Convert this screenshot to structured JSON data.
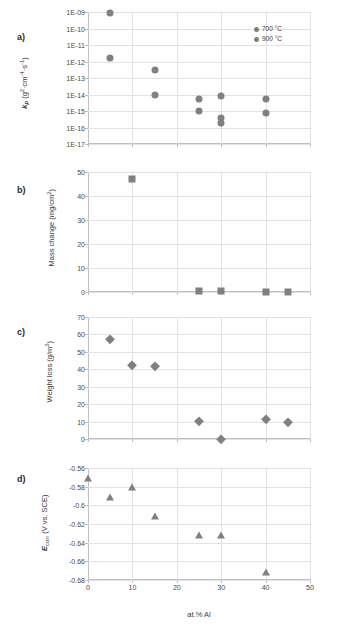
{
  "figure": {
    "xlabel": "at.% Al",
    "series_colors": {
      "marker": "#808080",
      "grid": "#e2e2e2",
      "axis": "#bfbfbf"
    }
  },
  "panels": [
    {
      "letter": "a)",
      "ylabel_plain": "kp (g2·cm-4·s-1)",
      "ylabel_parts": {
        "sym": "k",
        "sub": "p",
        "unit_open": " (g",
        "u1": "2",
        "u2": "·cm",
        "u3": "-4",
        "u4": "·s",
        "u5": "-1",
        "unit_close": ")"
      },
      "yticks": [
        "1E-09",
        "1E-10",
        "1E-11",
        "1E-12",
        "1E-13",
        "1E-14",
        "1E-15",
        "1E-16",
        "1E-17"
      ],
      "ylim_exp": [
        -17,
        -9
      ],
      "xticks": [
        "0",
        "10",
        "20",
        "30",
        "40",
        "50"
      ],
      "xlim": [
        0,
        50
      ],
      "legend": [
        {
          "label": "700 °C",
          "color": "#808080"
        },
        {
          "label": "900 °C",
          "color": "#808080"
        }
      ],
      "points": [
        {
          "x": 5,
          "y_exp": -9.05,
          "marker": "circle"
        },
        {
          "x": 5,
          "y_exp": -11.8,
          "marker": "circle"
        },
        {
          "x": 15,
          "y_exp": -12.5,
          "marker": "circle"
        },
        {
          "x": 15,
          "y_exp": -14.0,
          "marker": "circle"
        },
        {
          "x": 25,
          "y_exp": -14.25,
          "marker": "circle"
        },
        {
          "x": 25,
          "y_exp": -15.0,
          "marker": "circle"
        },
        {
          "x": 30,
          "y_exp": -14.1,
          "marker": "circle"
        },
        {
          "x": 30,
          "y_exp": -15.4,
          "marker": "circle"
        },
        {
          "x": 30,
          "y_exp": -15.75,
          "marker": "circle"
        },
        {
          "x": 40,
          "y_exp": -14.3,
          "marker": "circle"
        },
        {
          "x": 40,
          "y_exp": -15.1,
          "marker": "circle"
        }
      ]
    },
    {
      "letter": "b)",
      "ylabel_plain": "Mass change (mg/cm2)",
      "ylabel_parts": {
        "main": "Mass change (mg/cm",
        "sup": "2",
        "close": ")"
      },
      "yticks": [
        "50",
        "40",
        "30",
        "20",
        "10",
        "0"
      ],
      "ylim": [
        0,
        55
      ],
      "xticks": [
        "0",
        "10",
        "20",
        "30",
        "40",
        "50"
      ],
      "xlim": [
        0,
        50
      ],
      "points": [
        {
          "x": 10,
          "y": 52,
          "marker": "square"
        },
        {
          "x": 25,
          "y": 0.3,
          "marker": "square"
        },
        {
          "x": 30,
          "y": 0.3,
          "marker": "square"
        },
        {
          "x": 40,
          "y": 0.2,
          "marker": "square"
        },
        {
          "x": 45,
          "y": 0.2,
          "marker": "square"
        }
      ]
    },
    {
      "letter": "c)",
      "ylabel_plain": "Weight loss (g/m2)",
      "ylabel_parts": {
        "main": "Weight loss (g/m",
        "sup": "2",
        "close": ")"
      },
      "yticks": [
        "70",
        "60",
        "50",
        "40",
        "30",
        "20",
        "10",
        "0"
      ],
      "ylim": [
        0,
        70
      ],
      "xticks": [
        "0",
        "10",
        "20",
        "30",
        "40",
        "50"
      ],
      "xlim": [
        0,
        50
      ],
      "points": [
        {
          "x": 5,
          "y": 57.3,
          "marker": "diamond"
        },
        {
          "x": 10,
          "y": 42.3,
          "marker": "diamond"
        },
        {
          "x": 15,
          "y": 41.8,
          "marker": "diamond"
        },
        {
          "x": 25,
          "y": 10.3,
          "marker": "diamond"
        },
        {
          "x": 30,
          "y": 0.2,
          "marker": "diamond"
        },
        {
          "x": 40,
          "y": 11.3,
          "marker": "diamond"
        },
        {
          "x": 45,
          "y": 9.8,
          "marker": "diamond"
        }
      ]
    },
    {
      "letter": "d)",
      "ylabel_plain": "Ecorr (V vs. SCE)",
      "ylabel_parts": {
        "sym": "E",
        "sub": "corr",
        "rest": " (V vs. SCE)"
      },
      "yticks": [
        "-0.56",
        "-0.58",
        "-0.6",
        "-0.62",
        "-0.64",
        "-0.66",
        "-0.68"
      ],
      "ylim": [
        -0.68,
        -0.56
      ],
      "xticks": [
        "0",
        "10",
        "20",
        "30",
        "40",
        "50"
      ],
      "xlim": [
        0,
        50
      ],
      "points": [
        {
          "x": 0,
          "y": -0.5705,
          "marker": "triangle"
        },
        {
          "x": 5,
          "y": -0.591,
          "marker": "triangle"
        },
        {
          "x": 10,
          "y": -0.5805,
          "marker": "triangle"
        },
        {
          "x": 15,
          "y": -0.6115,
          "marker": "triangle"
        },
        {
          "x": 25,
          "y": -0.6315,
          "marker": "triangle"
        },
        {
          "x": 30,
          "y": -0.6315,
          "marker": "triangle"
        },
        {
          "x": 40,
          "y": -0.6715,
          "marker": "triangle"
        }
      ]
    }
  ]
}
